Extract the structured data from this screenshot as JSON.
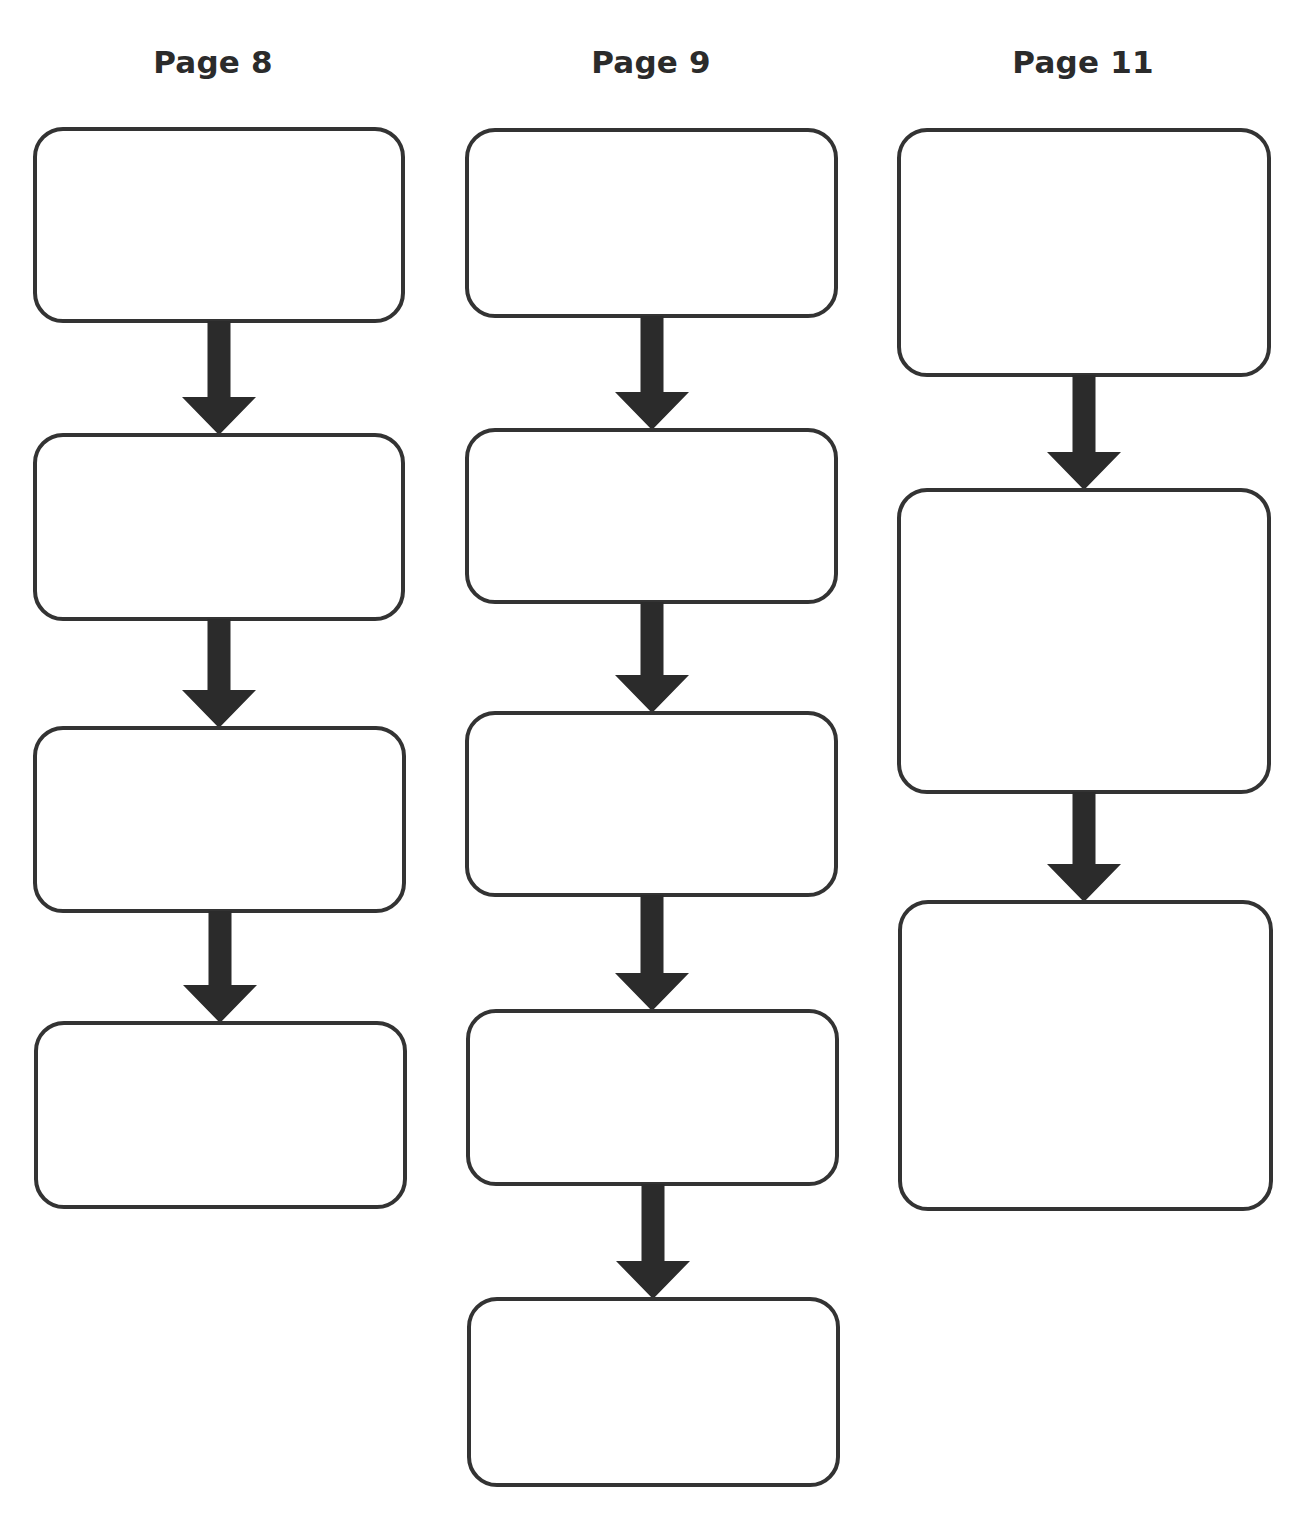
{
  "diagram": {
    "type": "flowchart-template",
    "stroke_color": "#333333",
    "arrow_color": "#2b2b2b",
    "title_color": "#2b2b2b",
    "columns": [
      {
        "id": "page-8",
        "title": "Page 8",
        "title_center_x": 213,
        "boxes": [
          {
            "x": 33,
            "y": 127,
            "w": 372,
            "h": 196,
            "text": ""
          },
          {
            "x": 33,
            "y": 433,
            "w": 372,
            "h": 188,
            "text": ""
          },
          {
            "x": 33,
            "y": 726,
            "w": 373,
            "h": 187,
            "text": ""
          },
          {
            "x": 34,
            "y": 1021,
            "w": 373,
            "h": 188,
            "text": ""
          }
        ]
      },
      {
        "id": "page-9",
        "title": "Page 9",
        "title_center_x": 651,
        "boxes": [
          {
            "x": 465,
            "y": 128,
            "w": 373,
            "h": 190,
            "text": ""
          },
          {
            "x": 465,
            "y": 428,
            "w": 373,
            "h": 176,
            "text": ""
          },
          {
            "x": 465,
            "y": 711,
            "w": 373,
            "h": 186,
            "text": ""
          },
          {
            "x": 466,
            "y": 1009,
            "w": 373,
            "h": 177,
            "text": ""
          },
          {
            "x": 467,
            "y": 1297,
            "w": 373,
            "h": 190,
            "text": ""
          }
        ]
      },
      {
        "id": "page-11",
        "title": "Page 11",
        "title_center_x": 1083,
        "boxes": [
          {
            "x": 897,
            "y": 128,
            "w": 374,
            "h": 249,
            "text": ""
          },
          {
            "x": 897,
            "y": 488,
            "w": 374,
            "h": 306,
            "text": ""
          },
          {
            "x": 898,
            "y": 900,
            "w": 375,
            "h": 311,
            "text": ""
          }
        ]
      }
    ],
    "arrow_geometry": {
      "shaft_width": 23,
      "head_width": 74,
      "head_height": 38
    }
  }
}
